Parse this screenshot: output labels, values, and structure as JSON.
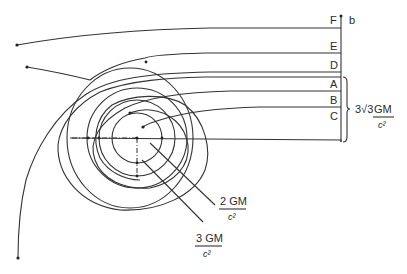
{
  "figure": {
    "trajectory_labels": [
      "F",
      "E",
      "D",
      "A",
      "B",
      "C"
    ],
    "impact_axis_label": "b",
    "critical_impact": {
      "coefficient": "3√3",
      "numerator": "GM",
      "denominator": "c²"
    },
    "photon_sphere": {
      "numerator": "3 GM",
      "denominator": "c²"
    },
    "horizon": {
      "numerator": "2 GM",
      "denominator": "c²"
    }
  }
}
